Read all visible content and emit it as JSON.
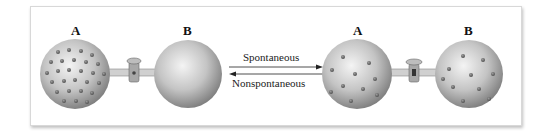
{
  "diagram": {
    "left_state": {
      "flask_a_label": "A",
      "flask_b_label": "B",
      "flask_a": "filled with gas particles",
      "flask_b": "empty"
    },
    "right_state": {
      "flask_a_label": "A",
      "flask_b_label": "B",
      "flask_a": "gas particles distributed",
      "flask_b": "gas particles distributed"
    },
    "arrows": {
      "forward_label": "Spontaneous",
      "reverse_label": "Nonspontaneous"
    },
    "colors": {
      "sphere": "#b8b8b8",
      "particle": "#6a6a6a",
      "frame_border": "#d8d8d8"
    }
  }
}
